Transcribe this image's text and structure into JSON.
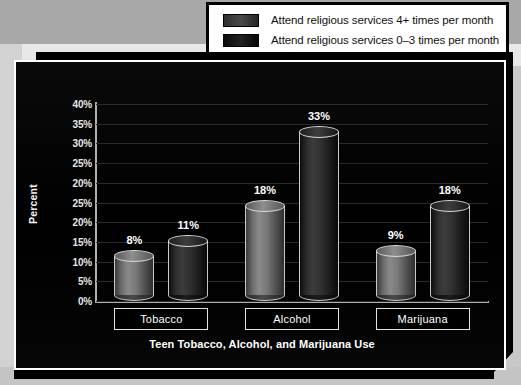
{
  "legend": {
    "entries": [
      {
        "label": "Attend religious services 4+ times per month",
        "swatch": "legend-swatch-dark-gray"
      },
      {
        "label": "Attend religious services 0–3 times per month",
        "swatch": "legend-swatch-black"
      }
    ]
  },
  "chart_data": {
    "type": "bar",
    "title": "",
    "xlabel": "Teen Tobacco, Alcohol, and Marijuana Use",
    "ylabel": "Percent",
    "categories": [
      "Tobacco",
      "Alcohol",
      "Marijuana"
    ],
    "series": [
      {
        "name": "Attend religious services 4+ times per month",
        "values": [
          8,
          18,
          9
        ],
        "labels": [
          "8%",
          "18%",
          "9%"
        ],
        "color": "#8a8a8a"
      },
      {
        "name": "Attend religious services 0–3 times per month",
        "values": [
          11,
          33,
          18
        ],
        "labels": [
          "11%",
          "33%",
          "18%"
        ],
        "color": "#1a1a1a"
      }
    ],
    "ylim": [
      0,
      40
    ],
    "yticks": [
      40,
      35,
      30,
      25,
      20,
      25,
      20,
      15,
      10,
      5,
      0
    ],
    "ytick_labels": [
      "40%",
      "35%",
      "30%",
      "25%",
      "20%",
      "25%",
      "20%",
      "15%",
      "10%",
      "5%",
      "0%"
    ],
    "grid": true,
    "legend_position": "top-right",
    "background": "#000000",
    "text_color": "#ffffff"
  }
}
